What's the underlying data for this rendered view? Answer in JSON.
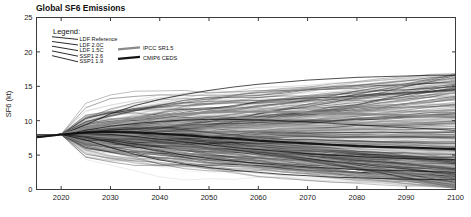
{
  "chart_data": {
    "type": "line",
    "title": "Global SF6 Emissions",
    "xlabel": "",
    "ylabel": "SF6 (kt)",
    "xlim": [
      2015,
      2100
    ],
    "ylim": [
      0,
      25
    ],
    "xticks": [
      2020,
      2030,
      2040,
      2050,
      2060,
      2070,
      2080,
      2090,
      2100
    ],
    "yticks": [
      0,
      5,
      10,
      15,
      20,
      25
    ],
    "grid": false,
    "legend_position": "upper-left-inside",
    "x": [
      2015,
      2020,
      2025,
      2030,
      2035,
      2040,
      2045,
      2050,
      2055,
      2060,
      2065,
      2070,
      2075,
      2080,
      2085,
      2090,
      2095,
      2100
    ],
    "start_value": 8.0,
    "series": [
      {
        "name": "LDF Reference",
        "style": "thin-dark",
        "values": [
          7.6,
          8.0,
          9.4,
          11.0,
          12.2,
          13.1,
          13.8,
          14.4,
          14.9,
          15.3,
          15.6,
          15.9,
          16.1,
          16.3,
          16.4,
          16.5,
          16.6,
          16.6
        ]
      },
      {
        "name": "LDF 2.0C",
        "style": "thin-dark",
        "values": [
          7.6,
          8.0,
          8.6,
          9.2,
          9.6,
          9.9,
          10.1,
          10.2,
          10.2,
          10.1,
          10.0,
          9.8,
          9.6,
          9.4,
          9.2,
          9.0,
          8.8,
          8.6
        ]
      },
      {
        "name": "LDF 1.5C",
        "style": "thin-dark",
        "values": [
          7.6,
          8.0,
          8.1,
          8.0,
          7.7,
          7.3,
          6.9,
          6.5,
          6.1,
          5.8,
          5.5,
          5.2,
          5.0,
          4.8,
          4.6,
          4.5,
          4.4,
          4.3
        ]
      },
      {
        "name": "SSP1 2.6",
        "style": "thin-dark",
        "values": [
          7.6,
          8.0,
          7.6,
          6.9,
          6.2,
          5.6,
          5.0,
          4.5,
          4.1,
          3.8,
          3.5,
          3.3,
          3.1,
          2.9,
          2.8,
          2.7,
          2.6,
          2.5
        ]
      },
      {
        "name": "SSP1 1.9",
        "style": "thin-dark",
        "values": [
          7.6,
          8.0,
          7.2,
          6.1,
          5.1,
          4.3,
          3.7,
          3.2,
          2.8,
          2.5,
          2.2,
          2.0,
          1.8,
          1.7,
          1.6,
          1.5,
          1.45,
          1.4
        ]
      },
      {
        "name": "IPCC SR1.5",
        "style": "thick-gray",
        "values": [
          7.6,
          8.0,
          8.9,
          9.7,
          10.3,
          10.7,
          11.0,
          11.2,
          11.3,
          11.3,
          11.3,
          11.2,
          11.1,
          11.0,
          10.9,
          10.8,
          10.7,
          10.6
        ]
      },
      {
        "name": "CMIP6 CEDS",
        "style": "thick-dark",
        "values": [
          7.6,
          8.0,
          8.3,
          8.4,
          8.3,
          8.1,
          7.9,
          7.6,
          7.4,
          7.1,
          6.9,
          6.7,
          6.5,
          6.3,
          6.2,
          6.1,
          6.0,
          5.9
        ]
      }
    ],
    "legend": {
      "title": "Legend:",
      "left_entries": [
        {
          "label": "LDF Reference",
          "swatch": "thin-dark"
        },
        {
          "label": "LDF 2.0C",
          "swatch": "thin-dark"
        },
        {
          "label": "LDF 1.5C",
          "swatch": "thin-dark"
        },
        {
          "label": "SSP1 2.6",
          "swatch": "thin-dark"
        },
        {
          "label": "SSP1 1.9",
          "swatch": "thin-dark"
        }
      ],
      "right_entries": [
        {
          "label": "IPCC SR1.5",
          "swatch": "thick-gray"
        },
        {
          "label": "CMIP6 CEDS",
          "swatch": "thick-dark"
        }
      ]
    },
    "ensemble": {
      "count": 420,
      "description": "Background ensemble members drawn from the same 2020 pivot with varied growth/decline rates.",
      "y_pivot": 8.0,
      "end_min": 0.2,
      "end_max": 17.0,
      "colors": [
        "#000000",
        "#1c1c1c",
        "#3a3a3a",
        "#5a5a5a",
        "#7d7d7d",
        "#a5a5a5",
        "#c4c4c4"
      ]
    }
  },
  "colors": {
    "background": "#ffffff",
    "frame": "#3b3b3b",
    "text": "#111111",
    "series_dark": "#101010",
    "series_gray": "#8a8a8a"
  }
}
